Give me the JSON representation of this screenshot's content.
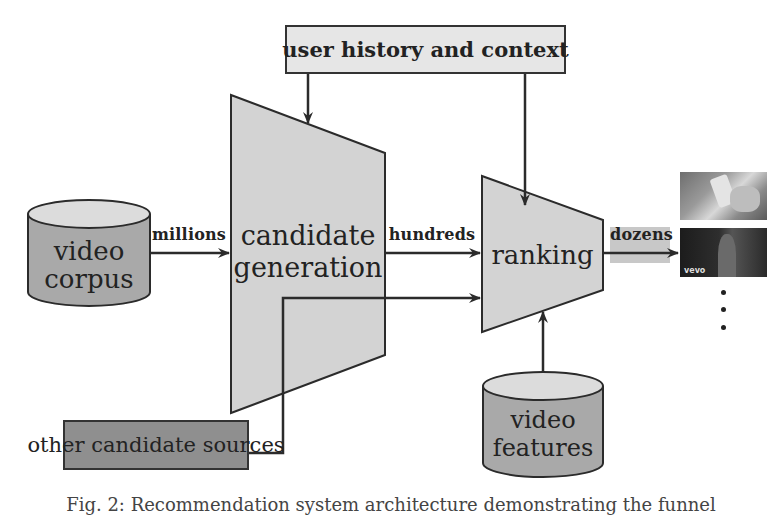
{
  "diagram": {
    "nodes": {
      "user_history": {
        "label": "user history and context",
        "fill": "#e6e6e6"
      },
      "video_corpus": {
        "label_line1": "video",
        "label_line2": "corpus",
        "fill": "#a9a9a9",
        "top_fill": "#dcdcdc"
      },
      "candidate_generation": {
        "label_line1": "candidate",
        "label_line2": "generation",
        "fill": "#d3d3d3"
      },
      "ranking": {
        "label": "ranking",
        "fill": "#d3d3d3"
      },
      "other_candidate_sources": {
        "label": "other candidate sources",
        "fill": "#8f8f8f"
      },
      "video_features": {
        "label_line1": "video",
        "label_line2": "features",
        "fill": "#a9a9a9",
        "top_fill": "#dcdcdc"
      }
    },
    "edges": {
      "corpus_to_candidate": {
        "label": "millions"
      },
      "candidate_to_ranking": {
        "label": "hundreds"
      },
      "ranking_to_output": {
        "label": "dozens",
        "highlight": "#c8c8c8"
      }
    },
    "outputs": {
      "thumbnail_1": {
        "description": "hands holding smartphone"
      },
      "thumbnail_2": {
        "description": "music video still",
        "watermark": "vevo"
      },
      "ellipsis_dots": 3
    },
    "colors": {
      "stroke": "#2b2b2b",
      "text": "#222222",
      "background": "#ffffff"
    }
  },
  "caption": "Fig. 2: Recommendation system architecture demonstrating the funnel"
}
